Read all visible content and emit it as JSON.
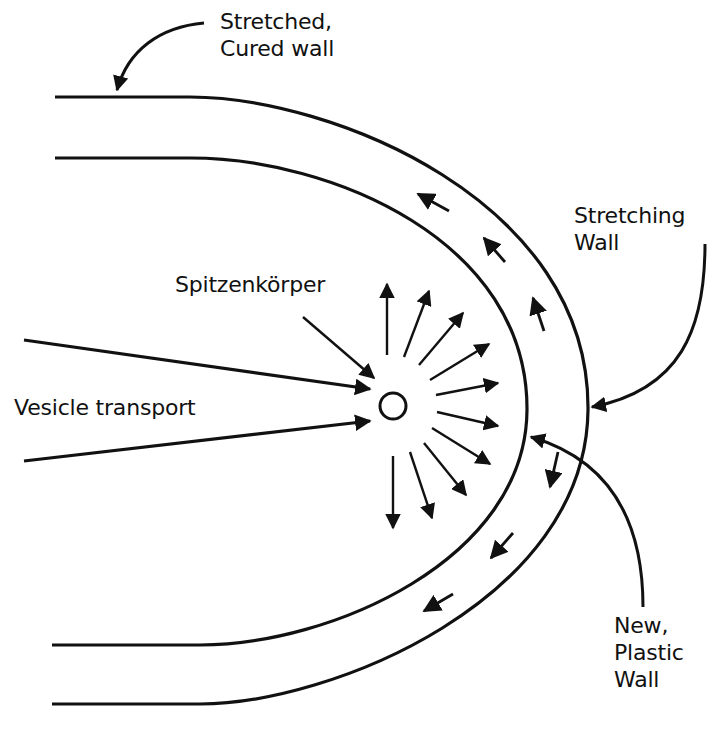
{
  "diagram": {
    "colors": {
      "ink": "#111111",
      "background": "#ffffff"
    },
    "labels": {
      "stretched_cured": [
        "Stretched,",
        "Cured wall"
      ],
      "stretching": [
        "Stretching",
        "Wall"
      ],
      "spitzenkorper": "Spitzenkörper",
      "vesicle_transport": "Vesicle transport",
      "new_plastic": [
        "New,",
        "Plastic",
        "Wall"
      ]
    },
    "elements": {
      "outer_wall": "Outer cell wall (stretched, cured)",
      "inner_wall": "Inner cell wall (new, plastic)",
      "spitzenkorper_body": "Spitzenkörper vesicle supply center",
      "vesicle_arrows_count": 2,
      "radiating_arrows_count": 13,
      "wall_flow_arrows_count": 6
    }
  }
}
